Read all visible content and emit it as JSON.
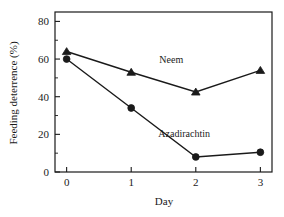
{
  "chart_data": {
    "type": "line",
    "title": "",
    "xlabel": "Day",
    "ylabel": "Feeding deterrence (%)",
    "x": [
      0,
      1,
      2,
      3
    ],
    "xlim": [
      -0.18,
      3.18
    ],
    "ylim": [
      0,
      85
    ],
    "xticks": [
      "0",
      "1",
      "2",
      "3"
    ],
    "yticks": [
      "0",
      "20",
      "40",
      "60",
      "80"
    ],
    "ytick_values": [
      0,
      20,
      40,
      60,
      80
    ],
    "y_minor_values": [
      10,
      30,
      50,
      70
    ],
    "grid": false,
    "legend_position": "inline-annotation",
    "series": [
      {
        "name": "Neem",
        "marker": "triangle",
        "values": [
          64,
          53,
          42.5,
          54
        ],
        "annotation": "Neem"
      },
      {
        "name": "Azadirachtin",
        "marker": "circle",
        "values": [
          60,
          34,
          8,
          10.5
        ],
        "annotation": "Azadirachtin"
      }
    ],
    "annotations": [
      {
        "text": "Neem",
        "x": 1.62,
        "y": 58
      },
      {
        "text": "Azadirachtin",
        "x": 1.82,
        "y": 18.5
      }
    ],
    "colors": {
      "axis": "#1a1a1a",
      "line": "#1a1a1a",
      "marker": "#1a1a1a",
      "background": "#ffffff"
    }
  }
}
